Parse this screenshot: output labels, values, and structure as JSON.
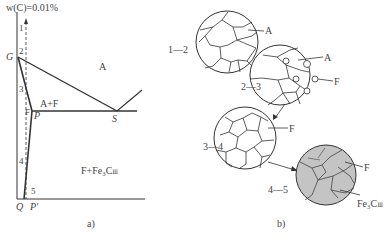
{
  "panel_a": {
    "caption": "a)",
    "composition_label": "w(C)=0.01%",
    "points": {
      "G": "G",
      "P": "P",
      "S": "S",
      "Q": "Q",
      "P_prime": "P′",
      "F_axis": "F"
    },
    "regions": {
      "austenite": "A",
      "two_phase": "A+F",
      "lower": "F+Fe₃C",
      "lower_sub": "Ⅲ"
    },
    "cooling_steps": [
      "1",
      "2",
      "3",
      "4",
      "5"
    ]
  },
  "panel_b": {
    "caption": "b)",
    "stages": [
      {
        "range": "1—2",
        "labels": [
          "A"
        ]
      },
      {
        "range": "2—3",
        "labels": [
          "A",
          "F"
        ]
      },
      {
        "range": "3—4",
        "labels": [
          "F"
        ]
      },
      {
        "range": "4—5",
        "labels": [
          "F",
          "Fe₃C",
          "Ⅲ"
        ]
      }
    ]
  },
  "colors": {
    "line": "#333333",
    "shaded": "#c4c4c4",
    "background": "#ffffff"
  }
}
